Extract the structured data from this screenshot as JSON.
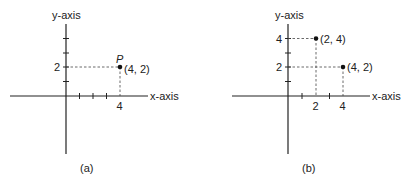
{
  "panels": [
    {
      "id": "a",
      "caption": "(a)",
      "x_axis_label": "x-axis",
      "y_axis_label": "y-axis",
      "x_tick_label": "4",
      "y_tick_label": "2",
      "point_name": "P",
      "points": [
        {
          "label": "(4, 2)",
          "x": 4,
          "y": 2
        }
      ]
    },
    {
      "id": "b",
      "caption": "(b)",
      "x_axis_label": "x-axis",
      "y_axis_label": "y-axis",
      "x_tick_labels": [
        "2",
        "4"
      ],
      "y_tick_labels": [
        "2",
        "4"
      ],
      "points": [
        {
          "label": "(2, 4)",
          "x": 2,
          "y": 4
        },
        {
          "label": "(4, 2)",
          "x": 4,
          "y": 2
        }
      ]
    }
  ]
}
